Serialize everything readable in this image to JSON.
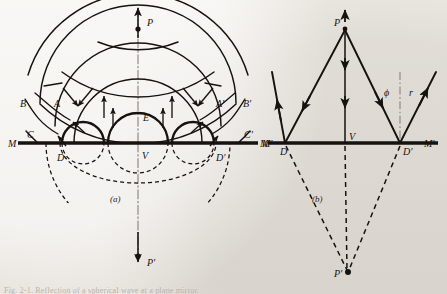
{
  "figure": {
    "title_hint": "Reflection of spherical wavefronts at a plane mirror",
    "background_color": "#eeebe6",
    "ink_color": "#15120f",
    "caption_text": "Fig. 2-1.  Reflection of a spherical wave at a plane mirror.",
    "panels": [
      {
        "key": "a",
        "label": "(a)",
        "description": "wavefront construction"
      },
      {
        "key": "b",
        "label": "(b)",
        "description": "ray construction"
      }
    ]
  },
  "panel_a": {
    "label": "(a)",
    "source_point": {
      "name": "P",
      "label": "P",
      "x": 138,
      "y": 22
    },
    "image_point": {
      "name": "P-prime",
      "label": "P'",
      "x": 138,
      "y": 262
    },
    "mirror_line": {
      "name": "mirror",
      "left_label": "M",
      "right_label": "M'",
      "y": 143,
      "x1": 18,
      "x2": 258
    },
    "vertex": {
      "label": "V",
      "x": 138,
      "y": 153
    },
    "center_wave_point": {
      "label": "E",
      "x": 143,
      "y": 118
    },
    "left_labels": [
      {
        "label": "B",
        "x": 22,
        "y": 103
      },
      {
        "label": "A",
        "x": 56,
        "y": 104
      },
      {
        "label": "C",
        "x": 29,
        "y": 135
      },
      {
        "label": "D",
        "x": 60,
        "y": 158
      },
      {
        "label": "M",
        "x": 10,
        "y": 146
      }
    ],
    "right_labels": [
      {
        "label": "A'",
        "x": 219,
        "y": 104
      },
      {
        "label": "B'",
        "x": 246,
        "y": 103
      },
      {
        "label": "C'",
        "x": 247,
        "y": 135
      },
      {
        "label": "D'",
        "x": 221,
        "y": 158
      },
      {
        "label": "M'",
        "x": 265,
        "y": 146
      }
    ],
    "incident_wavefront_radii": [
      38,
      62,
      86,
      110
    ],
    "reflected_wavefront_radii": [
      30,
      56,
      80,
      104
    ],
    "arrow_count_incident": 6,
    "arrow_count_reflected": 4
  },
  "panel_b": {
    "label": "(b)",
    "source_point": {
      "name": "P",
      "label": "P",
      "x": 345,
      "y": 27
    },
    "image_point": {
      "name": "P-prime",
      "label": "P'",
      "x": 348,
      "y": 272
    },
    "mirror_line": {
      "name": "mirror",
      "left_label": "M",
      "right_label": "M'",
      "y": 143,
      "x1": 268,
      "x2": 438
    },
    "vertex": {
      "label": "V",
      "x": 345,
      "y": 143,
      "text_x": 351,
      "text_y": 140
    },
    "reflection_points": [
      {
        "label": "D",
        "x": 285,
        "y": 143
      },
      {
        "label": "D'",
        "x": 400,
        "y": 143
      }
    ],
    "angle_labels": [
      {
        "name": "angle-phi",
        "label": "ϕ",
        "x": 386,
        "y": 93
      },
      {
        "name": "angle-r",
        "label": "r",
        "x": 412,
        "y": 93
      }
    ],
    "normal_line": {
      "x": 400,
      "y_top": 75,
      "y_bottom": 140,
      "style": "dash-dot"
    },
    "rays": [
      {
        "name": "ray-incident-left",
        "from": "P",
        "to": "D"
      },
      {
        "name": "ray-reflected-left",
        "from": "D",
        "to": "upper-left"
      },
      {
        "name": "ray-normal-incidence",
        "from": "P",
        "to": "V"
      },
      {
        "name": "ray-incident-right",
        "from": "P",
        "to": "D-prime"
      },
      {
        "name": "ray-reflected-right",
        "from": "D-prime",
        "to": "upper-right"
      },
      {
        "name": "virtual-ray-left",
        "from": "D",
        "to": "P-prime",
        "style": "dashed"
      },
      {
        "name": "virtual-ray-center",
        "from": "V",
        "to": "P-prime",
        "style": "dashed"
      },
      {
        "name": "virtual-ray-right",
        "from": "D-prime",
        "to": "P-prime",
        "style": "dashed"
      }
    ]
  }
}
